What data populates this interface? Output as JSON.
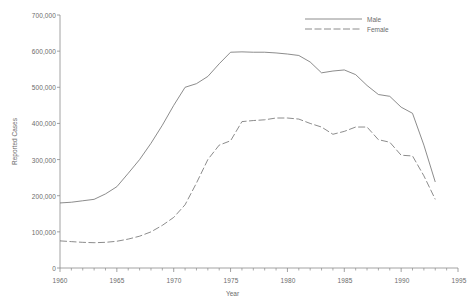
{
  "chart_data": {
    "type": "line",
    "title": "",
    "xlabel": "Year",
    "ylabel": "Reported Cases",
    "xlim": [
      1960,
      1995
    ],
    "ylim": [
      0,
      700000
    ],
    "grid": false,
    "legend_position": "top-right",
    "x_ticks": [
      1960,
      1965,
      1970,
      1975,
      1980,
      1985,
      1990,
      1995
    ],
    "x_tick_labels": [
      "1960",
      "1965",
      "1970",
      "1975",
      "1980",
      "1985",
      "1990",
      "1995"
    ],
    "x_minor_tick_step": 1,
    "y_ticks": [
      0,
      100000,
      200000,
      300000,
      400000,
      500000,
      600000,
      700000
    ],
    "y_tick_labels": [
      "0",
      "100,000",
      "200,000",
      "300,000",
      "400,000",
      "500,000",
      "600,000",
      "700,000"
    ],
    "line_color": "#6e6e6e",
    "x": [
      1960,
      1961,
      1962,
      1963,
      1964,
      1965,
      1966,
      1967,
      1968,
      1969,
      1970,
      1971,
      1972,
      1973,
      1974,
      1975,
      1976,
      1977,
      1978,
      1979,
      1980,
      1981,
      1982,
      1983,
      1984,
      1985,
      1986,
      1987,
      1988,
      1989,
      1990,
      1991,
      1992,
      1993
    ],
    "series": [
      {
        "name": "Male",
        "style": "solid",
        "values": [
          180000,
          182000,
          186000,
          190000,
          205000,
          225000,
          262000,
          300000,
          345000,
          395000,
          450000,
          500000,
          510000,
          530000,
          565000,
          597000,
          598000,
          597000,
          597000,
          595000,
          592000,
          588000,
          570000,
          540000,
          545000,
          548000,
          535000,
          505000,
          480000,
          475000,
          445000,
          428000,
          340000,
          238000
        ]
      },
      {
        "name": "Female",
        "style": "dashed",
        "values": [
          75000,
          73000,
          71000,
          70000,
          71000,
          74000,
          80000,
          88000,
          100000,
          118000,
          140000,
          175000,
          235000,
          300000,
          340000,
          352000,
          405000,
          408000,
          410000,
          415000,
          415000,
          412000,
          400000,
          390000,
          370000,
          378000,
          390000,
          390000,
          355000,
          348000,
          312000,
          310000,
          255000,
          190000
        ]
      }
    ],
    "annotations": []
  },
  "legend": {
    "items": [
      {
        "label": "Male",
        "style": "solid"
      },
      {
        "label": "Female",
        "style": "dashed"
      }
    ]
  },
  "axes": {
    "x_title": "Year",
    "y_title": "Reported Cases"
  }
}
